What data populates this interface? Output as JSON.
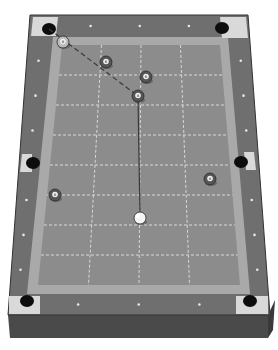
{
  "scene": {
    "title": "Pool table shot diagram",
    "view": "perspective"
  },
  "colors": {
    "background": "#ffffff",
    "frame_side": "#4a4a4a",
    "frame_top": "#6f6f6f",
    "rail": "#7d7d7d",
    "cushion": "#a9a9a9",
    "cloth": "#8c8c8c",
    "grid": "#d8d8d8",
    "pocket": "#0d0d0d",
    "pocket_plate": "#d9d9d9",
    "diamond": "#e6e6e6",
    "aim_line": "#3a3a3a",
    "cue_line": "#3a3a3a",
    "ball_dark": "#555555",
    "cue_ball": "#f4f4f4"
  },
  "pockets": [
    {
      "name": "top-left"
    },
    {
      "name": "top-right"
    },
    {
      "name": "middle-left"
    },
    {
      "name": "middle-right"
    },
    {
      "name": "bottom-left"
    },
    {
      "name": "bottom-right"
    }
  ],
  "balls": [
    {
      "id": "ball-a",
      "label": "8",
      "type": "object",
      "style": "light"
    },
    {
      "id": "ball-b",
      "label": "6",
      "type": "object",
      "style": "dark"
    },
    {
      "id": "ball-c",
      "label": "6",
      "type": "object",
      "style": "dark"
    },
    {
      "id": "ball-d",
      "label": "8",
      "type": "object",
      "style": "dark",
      "role": "target"
    },
    {
      "id": "ball-e",
      "label": "8",
      "type": "object",
      "style": "dark"
    },
    {
      "id": "ball-f",
      "label": "8",
      "type": "object",
      "style": "dark"
    },
    {
      "id": "cue-ball",
      "label": "",
      "type": "cue",
      "style": "cue"
    }
  ],
  "lines": {
    "aim": {
      "style": "dashed",
      "from": "top-left",
      "to": "ball-d"
    },
    "cue": {
      "style": "solid",
      "from": "cue-ball",
      "to": "ball-d"
    }
  }
}
